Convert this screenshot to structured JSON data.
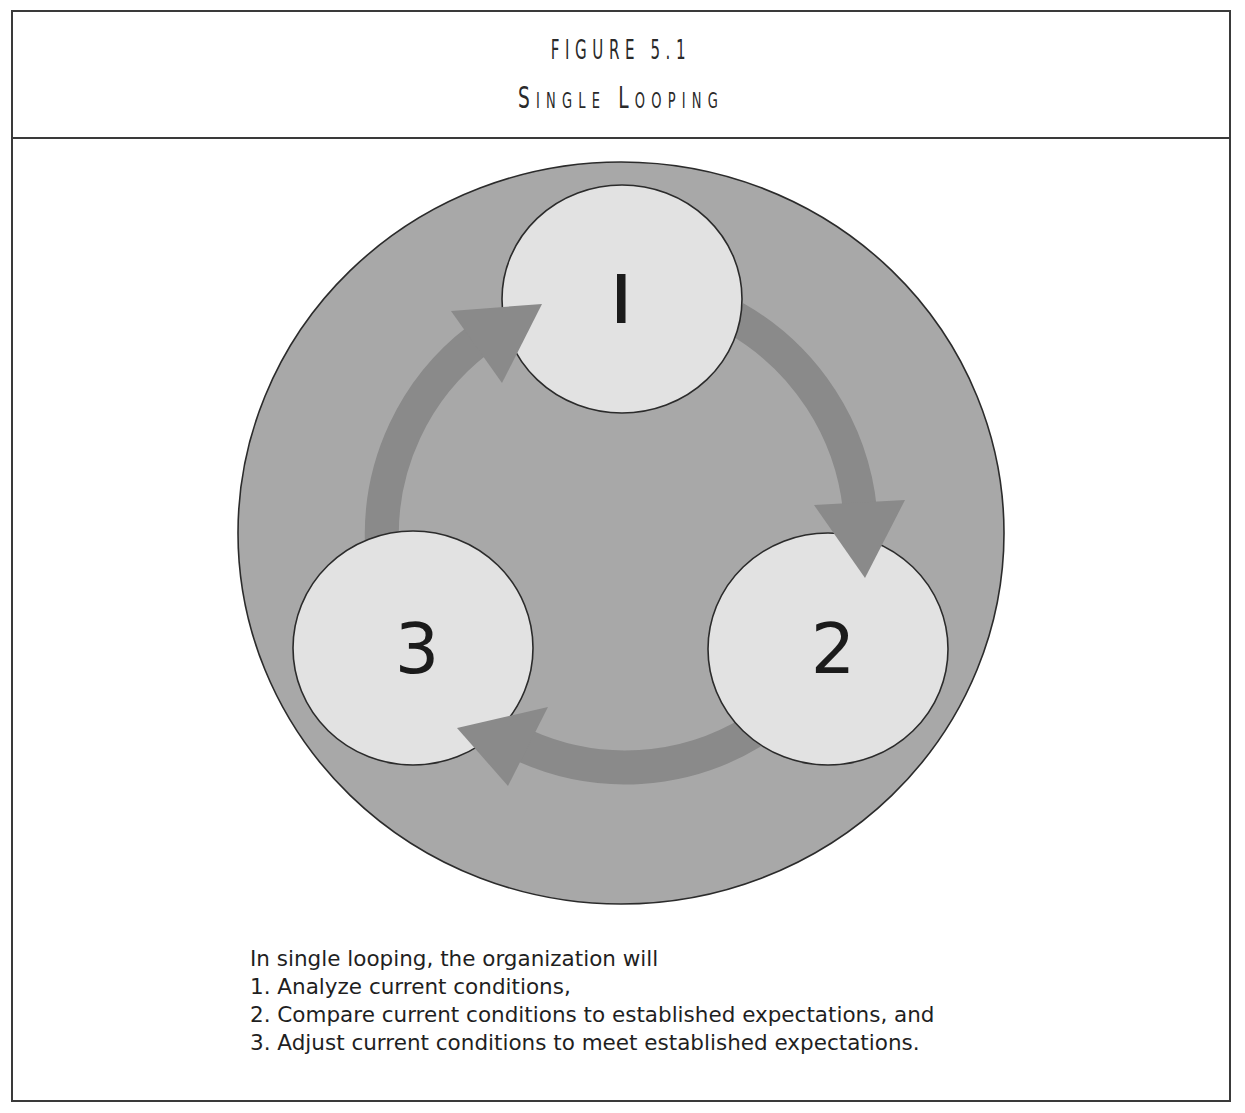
{
  "figure": {
    "number": "FIGURE 5.1",
    "title": "Single Looping"
  },
  "diagram": {
    "colors": {
      "outer_circle": "#a8a8a8",
      "node_fill": "#e2e2e2",
      "arrow": "#8a8a8a",
      "outline": "#2b2b2b",
      "label": "#1b1b1b"
    },
    "nodes": [
      {
        "id": 1,
        "label": "1",
        "step": "Analyze current conditions"
      },
      {
        "id": 2,
        "label": "2",
        "step": "Compare current conditions to established expectations"
      },
      {
        "id": 3,
        "label": "3",
        "step": "Adjust current conditions to meet established expectations"
      }
    ],
    "edges": [
      {
        "from": 1,
        "to": 2
      },
      {
        "from": 2,
        "to": 3
      },
      {
        "from": 3,
        "to": 1
      }
    ]
  },
  "caption": {
    "intro": "In single looping, the organization will",
    "items": [
      "1. Analyze current conditions,",
      "2. Compare current conditions to established expectations, and",
      "3. Adjust current conditions to meet established expectations."
    ]
  }
}
